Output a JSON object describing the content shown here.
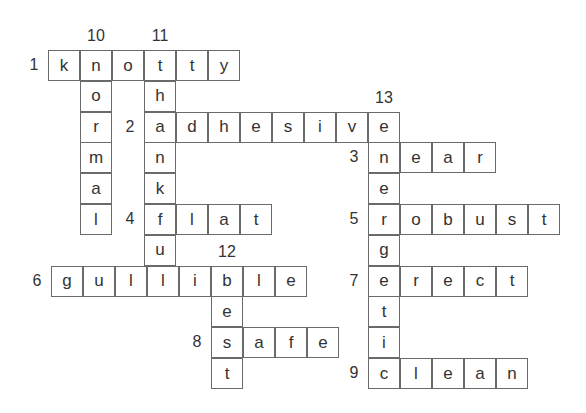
{
  "puzzle": {
    "type": "crossword",
    "cell_w": 32,
    "cell_h": 30.8,
    "origin_x": 48,
    "origin_y": 50,
    "across": [
      {
        "number": "1",
        "answer": "knotty",
        "row": 0,
        "col": 0,
        "dx": 0
      },
      {
        "number": "2",
        "answer": "adhesive",
        "row": 2,
        "col": 3,
        "dx": 0
      },
      {
        "number": "3",
        "answer": "near",
        "row": 3,
        "col": 10,
        "dx": 0
      },
      {
        "number": "4",
        "answer": "flat",
        "row": 5,
        "col": 3,
        "dx": 0
      },
      {
        "number": "5",
        "answer": "robust",
        "row": 5,
        "col": 10,
        "dx": 0
      },
      {
        "number": "6",
        "answer": "gullible",
        "row": 7,
        "col": 0,
        "dx": 3
      },
      {
        "number": "7",
        "answer": "erect",
        "row": 7,
        "col": 10,
        "dx": 0
      },
      {
        "number": "8",
        "answer": "safe",
        "row": 9,
        "col": 5,
        "dx": 3
      },
      {
        "number": "9",
        "answer": "clean",
        "row": 10,
        "col": 10,
        "dx": 0
      }
    ],
    "down": [
      {
        "number": "10",
        "answer": "normal",
        "row": 0,
        "col": 1,
        "dx": 0
      },
      {
        "number": "11",
        "answer": "thankful",
        "row": 0,
        "col": 3,
        "dx": 0
      },
      {
        "number": "12",
        "answer": "best",
        "row": 7,
        "col": 5,
        "dx": 3
      },
      {
        "number": "13",
        "answer": "energetic",
        "row": 2,
        "col": 10,
        "dx": 0
      }
    ]
  }
}
